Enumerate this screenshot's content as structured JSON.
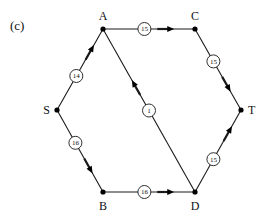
{
  "panel_label": "(c)",
  "nodes": [
    {
      "id": "A",
      "x": 103,
      "y": 29,
      "lx": 103,
      "ly": 20,
      "anchor": "middle"
    },
    {
      "id": "C",
      "x": 195,
      "y": 29,
      "lx": 195,
      "ly": 20,
      "anchor": "middle"
    },
    {
      "id": "S",
      "x": 57,
      "y": 110,
      "lx": 50,
      "ly": 114,
      "anchor": "end"
    },
    {
      "id": "T",
      "x": 241,
      "y": 110,
      "lx": 248,
      "ly": 114,
      "anchor": "start"
    },
    {
      "id": "B",
      "x": 103,
      "y": 192,
      "lx": 103,
      "ly": 210,
      "anchor": "middle"
    },
    {
      "id": "D",
      "x": 195,
      "y": 192,
      "lx": 195,
      "ly": 210,
      "anchor": "middle"
    }
  ],
  "edges": [
    {
      "from": "S",
      "to": "A",
      "weight": "14",
      "label_t": 0.42,
      "arrow_t": 0.75
    },
    {
      "from": "A",
      "to": "C",
      "weight": "15",
      "label_t": 0.45,
      "arrow_t": 0.72
    },
    {
      "from": "C",
      "to": "T",
      "weight": "15",
      "label_t": 0.4,
      "arrow_t": 0.72
    },
    {
      "from": "S",
      "to": "B",
      "weight": "16",
      "label_t": 0.4,
      "arrow_t": 0.72
    },
    {
      "from": "B",
      "to": "D",
      "weight": "16",
      "label_t": 0.45,
      "arrow_t": 0.72
    },
    {
      "from": "D",
      "to": "T",
      "weight": "15",
      "label_t": 0.4,
      "arrow_t": 0.75
    },
    {
      "from": "D",
      "to": "A",
      "weight": "1",
      "label_t": 0.5,
      "arrow_t": 0.66
    }
  ],
  "colors": {
    "line": "#1a1a1a",
    "node": "#000000",
    "circle_fill": "#ffffff"
  }
}
